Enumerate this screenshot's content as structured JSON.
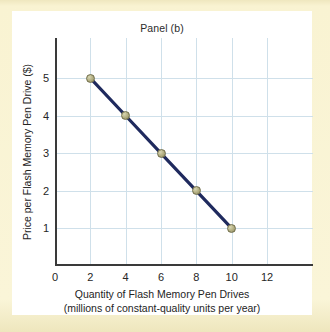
{
  "figure": {
    "title": "Panel (b)",
    "background_color": "#f8f2ce",
    "card_color": "#ffffff"
  },
  "chart_data": {
    "type": "line",
    "title": "Panel (b)",
    "xlabel_line1": "Quantity of Flash Memory Pen Drives",
    "xlabel_line2": "(millions of constant-quality units per year)",
    "ylabel": "Price per Flash Memory Pen Drive ($)",
    "x": [
      2,
      4,
      6,
      8,
      10
    ],
    "values": [
      5,
      4,
      3,
      2,
      1
    ],
    "points": [
      {
        "x": 2,
        "y": 5
      },
      {
        "x": 4,
        "y": 4
      },
      {
        "x": 6,
        "y": 3
      },
      {
        "x": 8,
        "y": 2
      },
      {
        "x": 10,
        "y": 1
      }
    ],
    "xlim": [
      0,
      14.6
    ],
    "ylim": [
      0,
      6.07
    ],
    "xticks": [
      0,
      2,
      4,
      6,
      8,
      10,
      12
    ],
    "yticks": [
      1,
      2,
      3,
      4,
      5
    ],
    "xtick_labels": [
      "0",
      "2",
      "4",
      "6",
      "8",
      "10",
      "12"
    ],
    "ytick_labels": [
      "1",
      "2",
      "3",
      "4",
      "5"
    ],
    "grid": true,
    "grid_color": "#cfe0ea",
    "legend": null,
    "line_color": "#1f2a5e",
    "marker_color": "#b8b488",
    "marker_edge_color": "#6f6c49",
    "axis_color": "#3a3a3a"
  }
}
